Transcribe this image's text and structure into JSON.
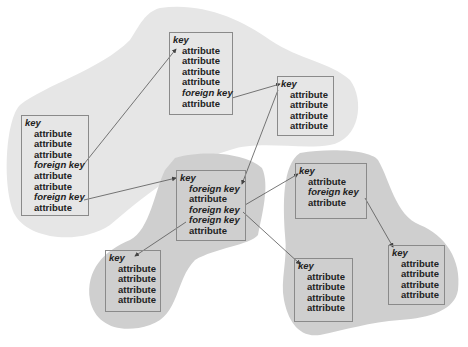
{
  "diagram": {
    "type": "entity-relationship clusters",
    "colors": {
      "cluster_light": "#e6e6e6",
      "cluster_dark": "#cfcfcf",
      "box_border": "#8a8a8a",
      "arrow": "#555555",
      "text": "#222222"
    },
    "entities": [
      {
        "id": "A",
        "cluster": "top",
        "rows": [
          {
            "kind": "key",
            "label": "key"
          },
          {
            "kind": "attr",
            "label": "attribute"
          },
          {
            "kind": "attr",
            "label": "attribute"
          },
          {
            "kind": "attr",
            "label": "attribute"
          },
          {
            "kind": "attr",
            "label": "attribute"
          },
          {
            "kind": "fk",
            "label": "foreign key"
          },
          {
            "kind": "attr",
            "label": "attribute"
          }
        ]
      },
      {
        "id": "B",
        "cluster": "top",
        "rows": [
          {
            "kind": "key",
            "label": "key"
          },
          {
            "kind": "attr",
            "label": "attribute"
          },
          {
            "kind": "attr",
            "label": "attribute"
          },
          {
            "kind": "attr",
            "label": "attribute"
          },
          {
            "kind": "attr",
            "label": "attribute"
          }
        ]
      },
      {
        "id": "C",
        "cluster": "top",
        "rows": [
          {
            "kind": "key",
            "label": "key"
          },
          {
            "kind": "attr",
            "label": "attribute"
          },
          {
            "kind": "attr",
            "label": "attribute"
          },
          {
            "kind": "attr",
            "label": "attribute"
          },
          {
            "kind": "fk",
            "label": "foreign key"
          },
          {
            "kind": "attr",
            "label": "attribute"
          },
          {
            "kind": "attr",
            "label": "attribute"
          },
          {
            "kind": "fk",
            "label": "foreign key"
          },
          {
            "kind": "attr",
            "label": "attribute"
          }
        ]
      },
      {
        "id": "D",
        "cluster": "bottom-left",
        "rows": [
          {
            "kind": "key",
            "label": "key"
          },
          {
            "kind": "fk",
            "label": "foreign key"
          },
          {
            "kind": "attr",
            "label": "attribute"
          },
          {
            "kind": "fk",
            "label": "foreign key"
          },
          {
            "kind": "fk",
            "label": "foreign key"
          },
          {
            "kind": "attr",
            "label": "attribute"
          }
        ]
      },
      {
        "id": "E",
        "cluster": "bottom-left",
        "rows": [
          {
            "kind": "key",
            "label": "key"
          },
          {
            "kind": "attr",
            "label": "attribute"
          },
          {
            "kind": "attr",
            "label": "attribute"
          },
          {
            "kind": "attr",
            "label": "attribute"
          },
          {
            "kind": "attr",
            "label": "attribute"
          }
        ]
      },
      {
        "id": "F",
        "cluster": "bottom-right",
        "rows": [
          {
            "kind": "key",
            "label": "key"
          },
          {
            "kind": "attr",
            "label": "attribute"
          },
          {
            "kind": "fk",
            "label": "foreign key"
          },
          {
            "kind": "attr",
            "label": "attribute"
          }
        ]
      },
      {
        "id": "G",
        "cluster": "bottom-right",
        "rows": [
          {
            "kind": "key",
            "label": "key"
          },
          {
            "kind": "attr",
            "label": "attribute"
          },
          {
            "kind": "attr",
            "label": "attribute"
          },
          {
            "kind": "attr",
            "label": "attribute"
          },
          {
            "kind": "attr",
            "label": "attribute"
          }
        ]
      },
      {
        "id": "H",
        "cluster": "bottom-right",
        "rows": [
          {
            "kind": "key",
            "label": "key"
          },
          {
            "kind": "attr",
            "label": "attribute"
          },
          {
            "kind": "attr",
            "label": "attribute"
          },
          {
            "kind": "attr",
            "label": "attribute"
          },
          {
            "kind": "attr",
            "label": "attribute"
          }
        ]
      }
    ],
    "relationships": [
      {
        "from": "C.foreign key (row 5)",
        "to": "A.key"
      },
      {
        "from": "C.foreign key (row 8)",
        "to": "D.key"
      },
      {
        "from": "A.foreign key",
        "to": "B.key"
      },
      {
        "from": "B.key",
        "to": "D.foreign key (row 2)"
      },
      {
        "from": "D.foreign key (row 4)",
        "to": "F.key"
      },
      {
        "from": "D.foreign key (row 4)",
        "to": "G.key"
      },
      {
        "from": "D.foreign key (row 5)",
        "to": "E.key"
      },
      {
        "from": "F.foreign key",
        "to": "H.key"
      }
    ]
  }
}
